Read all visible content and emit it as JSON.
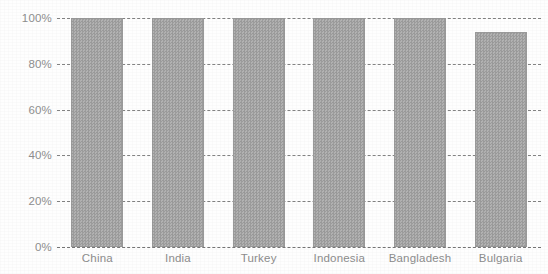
{
  "chart_data": {
    "type": "bar",
    "title": "",
    "subtitle": "",
    "xlabel": "",
    "ylabel": "",
    "categories": [
      "China",
      "India",
      "Turkey",
      "Indonesia",
      "Bangladesh",
      "Bulgaria"
    ],
    "values": [
      100,
      100,
      100,
      100,
      100,
      94
    ],
    "value_suffix": "%",
    "ylim": [
      0,
      100
    ],
    "yticks": [
      0,
      20,
      40,
      60,
      80,
      100
    ],
    "ytick_labels": [
      "0%",
      "20%",
      "40%",
      "60%",
      "80%",
      "100%"
    ],
    "grid": true,
    "grid_style": "dashed",
    "legend": false,
    "legend_position": "none",
    "series": [
      {
        "name": "",
        "values": [
          100,
          100,
          100,
          100,
          100,
          94
        ]
      }
    ],
    "colors": {
      "bar_fill": "#a6a6a6",
      "bar_border": "#9a9a9a",
      "gridline": "#6e6e6e",
      "tick_label": "#8d8d8d",
      "background": "#fefefe"
    }
  }
}
